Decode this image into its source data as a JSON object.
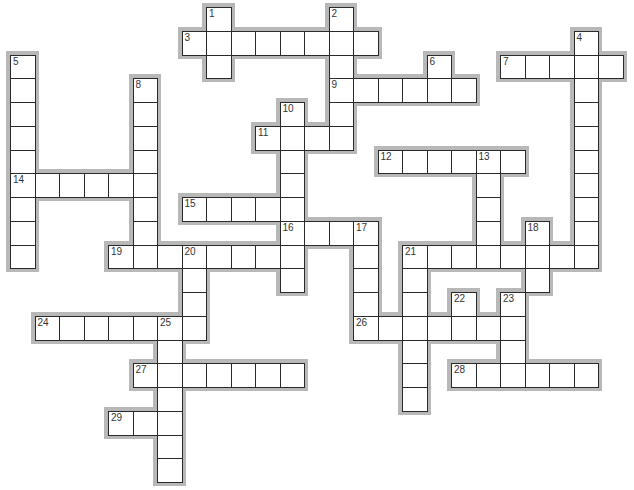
{
  "puzzle": {
    "grid": {
      "origin_x": 10,
      "origin_y": 7,
      "cell_w": 24.5,
      "cell_h": 23.75
    },
    "colors": {
      "cell_bg": "#ffffff",
      "cell_border": "#2a2a2a",
      "shadow": "#b8b8b8",
      "number": "#333333"
    },
    "entries": [
      {
        "number": 1,
        "direction": "down",
        "col": 8,
        "row": 0,
        "length": 3
      },
      {
        "number": 2,
        "direction": "down",
        "col": 13,
        "row": 0,
        "length": 6
      },
      {
        "number": 3,
        "direction": "across",
        "col": 7,
        "row": 1,
        "length": 8
      },
      {
        "number": 4,
        "direction": "down",
        "col": 23,
        "row": 1,
        "length": 10
      },
      {
        "number": 5,
        "direction": "down",
        "col": 0,
        "row": 2,
        "length": 9
      },
      {
        "number": 6,
        "direction": "down",
        "col": 17,
        "row": 2,
        "length": 2
      },
      {
        "number": 7,
        "direction": "across",
        "col": 20,
        "row": 2,
        "length": 5
      },
      {
        "number": 8,
        "direction": "down",
        "col": 5,
        "row": 3,
        "length": 8
      },
      {
        "number": 9,
        "direction": "across",
        "col": 13,
        "row": 3,
        "length": 6
      },
      {
        "number": 10,
        "direction": "down",
        "col": 11,
        "row": 4,
        "length": 8
      },
      {
        "number": 11,
        "direction": "across",
        "col": 10,
        "row": 5,
        "length": 4
      },
      {
        "number": 12,
        "direction": "across",
        "col": 15,
        "row": 6,
        "length": 6
      },
      {
        "number": 13,
        "direction": "down",
        "col": 19,
        "row": 6,
        "length": 5
      },
      {
        "number": 14,
        "direction": "across",
        "col": 0,
        "row": 7,
        "length": 6
      },
      {
        "number": 15,
        "direction": "across",
        "col": 7,
        "row": 8,
        "length": 5
      },
      {
        "number": 16,
        "direction": "across",
        "col": 11,
        "row": 9,
        "length": 4
      },
      {
        "number": 17,
        "direction": "down",
        "col": 14,
        "row": 9,
        "length": 5
      },
      {
        "number": 18,
        "direction": "down",
        "col": 21,
        "row": 9,
        "length": 3
      },
      {
        "number": 19,
        "direction": "across",
        "col": 4,
        "row": 10,
        "length": 8
      },
      {
        "number": 20,
        "direction": "down",
        "col": 7,
        "row": 10,
        "length": 4
      },
      {
        "number": 21,
        "direction": "across",
        "col": 16,
        "row": 10,
        "length": 8
      },
      {
        "number": 21,
        "direction": "down",
        "col": 16,
        "row": 10,
        "length": 7
      },
      {
        "number": 22,
        "direction": "down",
        "col": 18,
        "row": 12,
        "length": 2
      },
      {
        "number": 23,
        "direction": "down",
        "col": 20,
        "row": 12,
        "length": 4
      },
      {
        "number": 24,
        "direction": "across",
        "col": 1,
        "row": 13,
        "length": 7
      },
      {
        "number": 25,
        "direction": "down",
        "col": 6,
        "row": 13,
        "length": 7
      },
      {
        "number": 26,
        "direction": "across",
        "col": 14,
        "row": 13,
        "length": 7
      },
      {
        "number": 27,
        "direction": "across",
        "col": 5,
        "row": 15,
        "length": 7
      },
      {
        "number": 28,
        "direction": "across",
        "col": 18,
        "row": 15,
        "length": 6
      },
      {
        "number": 29,
        "direction": "across",
        "col": 4,
        "row": 17,
        "length": 3
      }
    ]
  }
}
